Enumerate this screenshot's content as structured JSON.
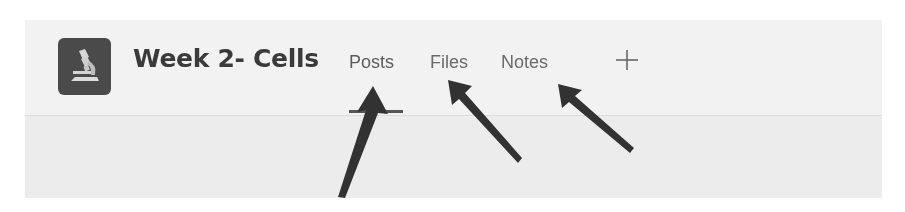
{
  "channel": {
    "icon": "microscope-icon",
    "title": "Week 2- Cells"
  },
  "tabs": [
    {
      "label": "Posts",
      "active": true
    },
    {
      "label": "Files",
      "active": false
    },
    {
      "label": "Notes",
      "active": false
    }
  ],
  "add_tab": {
    "icon": "plus-icon"
  },
  "annotations": {
    "arrows": [
      {
        "points_to": "Posts"
      },
      {
        "points_to": "Files"
      },
      {
        "points_to": "Notes"
      }
    ]
  },
  "colors": {
    "panel_bg": "#f1f1f1",
    "icon_bg": "#4a4a4a",
    "title": "#3a3a3a",
    "tab_text": "#6a6a6a",
    "arrow": "#333333"
  }
}
